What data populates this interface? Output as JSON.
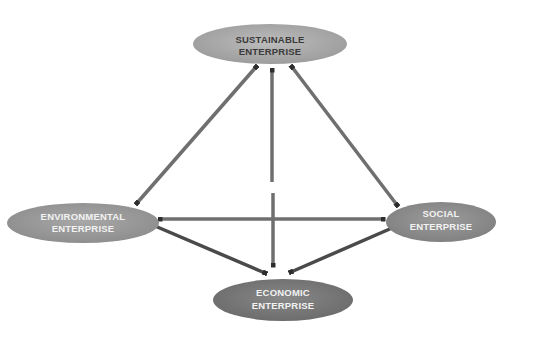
{
  "diagram": {
    "type": "relationship-diagram",
    "colors": {
      "background": "#ffffff",
      "arrow": "#6f6f6f",
      "arrowhead": "#2e2e2e",
      "sustainable_fill": "#a8a8a8",
      "environmental_fill": "#9a9a9a",
      "social_fill": "#8f8f8f",
      "economic_fill": "#7a7a7a",
      "dark_text": "#3a3a3a",
      "light_text": "#f2f2f2"
    },
    "nodes": [
      {
        "id": "sustainable",
        "line1": "SUSTAINABLE",
        "line2": "ENTERPRISE"
      },
      {
        "id": "environmental",
        "line1": "ENVIRONMENTAL",
        "line2": "ENTERPRISE"
      },
      {
        "id": "social",
        "line1": "SOCIAL",
        "line2": "ENTERPRISE"
      },
      {
        "id": "economic",
        "line1": "ECONOMIC",
        "line2": "ENTERPRISE"
      }
    ],
    "edges": [
      {
        "from": "environmental",
        "to": "sustainable",
        "bidirectional": true
      },
      {
        "from": "social",
        "to": "sustainable",
        "bidirectional": true
      },
      {
        "from": "economic",
        "to": "sustainable",
        "bidirectional": true
      },
      {
        "from": "environmental",
        "to": "social",
        "bidirectional": true
      },
      {
        "from": "environmental",
        "to": "economic",
        "bidirectional": false
      },
      {
        "from": "social",
        "to": "economic",
        "bidirectional": false
      }
    ]
  }
}
